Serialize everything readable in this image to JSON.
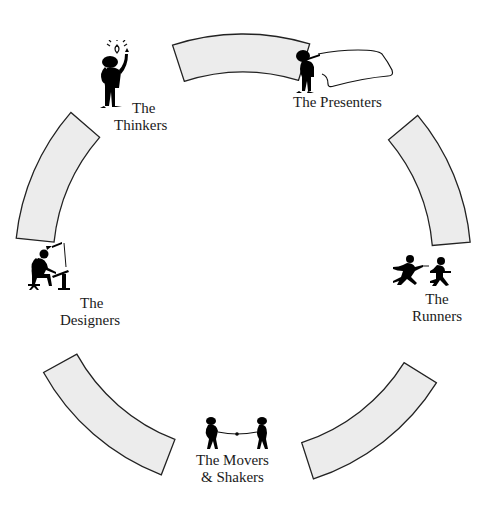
{
  "diagram": {
    "type": "cycle",
    "center": [
      243,
      262
    ],
    "ring": {
      "outer_radius": 228,
      "inner_radius": 190,
      "fill": "#ececec",
      "stroke": "#222222"
    },
    "segments": [
      {
        "id": "top",
        "start_deg": 73,
        "end_deg": 108
      },
      {
        "id": "right-upper",
        "start_deg": 5,
        "end_deg": 40
      },
      {
        "id": "right-lower",
        "start_deg": -72,
        "end_deg": -32
      },
      {
        "id": "left-lower",
        "start_deg": -151,
        "end_deg": -111
      },
      {
        "id": "left-upper",
        "start_deg": 139,
        "end_deg": 174
      }
    ],
    "nodes": [
      {
        "id": "thinkers",
        "line1": "The",
        "line2": "Thinkers",
        "icon": "thinker-lightbulb-icon"
      },
      {
        "id": "presenters",
        "line1": "The Presenters",
        "line2": "",
        "icon": "presenter-board-icon"
      },
      {
        "id": "runners",
        "line1": "The",
        "line2": "Runners",
        "icon": "runners-relay-icon"
      },
      {
        "id": "movers",
        "line1": "The Movers",
        "line2": "& Shakers",
        "icon": "tug-of-war-icon"
      },
      {
        "id": "designers",
        "line1": "The",
        "line2": "Designers",
        "icon": "designer-drafting-table-icon"
      }
    ]
  }
}
